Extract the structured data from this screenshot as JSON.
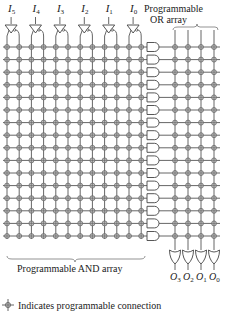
{
  "inputs": [
    "I5",
    "I4",
    "I3",
    "I2",
    "I1",
    "I0"
  ],
  "input_labels": [
    {
      "main": "I",
      "sub": "5"
    },
    {
      "main": "I",
      "sub": "4"
    },
    {
      "main": "I",
      "sub": "3"
    },
    {
      "main": "I",
      "sub": "2"
    },
    {
      "main": "I",
      "sub": "1"
    },
    {
      "main": "I",
      "sub": "0"
    }
  ],
  "outputs": [
    {
      "main": "O",
      "sub": "3"
    },
    {
      "main": "O",
      "sub": "2"
    },
    {
      "main": "O",
      "sub": "1"
    },
    {
      "main": "O",
      "sub": "0"
    }
  ],
  "and_rows": 16,
  "or_array_label_line1": "Programmable",
  "or_array_label_line2": "OR array",
  "and_array_label": "Programmable AND array",
  "legend_text": "Indicates programmable connection",
  "colors": {
    "line": "#666666",
    "dot": "#888888",
    "gate": "#444444",
    "text": "#222222"
  }
}
